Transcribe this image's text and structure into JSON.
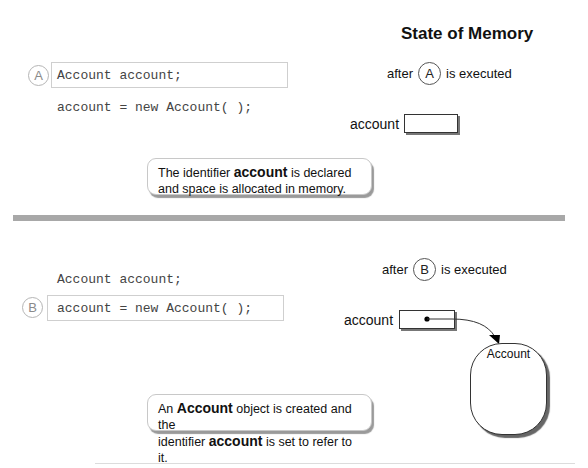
{
  "header": {
    "title": "State of Memory"
  },
  "section_a": {
    "step_label": "A",
    "code_lines": [
      "Account account;",
      "account = new Account( );"
    ],
    "highlighted_line_index": 0,
    "memory": {
      "after_prefix": "after",
      "after_step": "A",
      "after_suffix": "is executed",
      "variable_label": "account",
      "variable_value": ""
    },
    "note": {
      "line1_pre": "The identifier ",
      "line1_bold": "account",
      "line1_post": " is declared",
      "line2": "and space is allocated in memory."
    }
  },
  "section_b": {
    "step_label": "B",
    "code_lines": [
      "Account account;",
      "account = new Account( );"
    ],
    "highlighted_line_index": 1,
    "memory": {
      "after_prefix": "after",
      "after_step": "B",
      "after_suffix": "is executed",
      "variable_label": "account",
      "object_label": "Account"
    },
    "note": {
      "line1_pre": "An ",
      "line1_bold": "Account",
      "line1_post": " object is created and the",
      "line2_pre": "identifier ",
      "line2_bold": "account",
      "line2_post": " is set to refer to it."
    }
  },
  "colors": {
    "divider": "#a8a8a8",
    "code_text": "#444444",
    "step_circle_light": "#b5b5b5"
  }
}
